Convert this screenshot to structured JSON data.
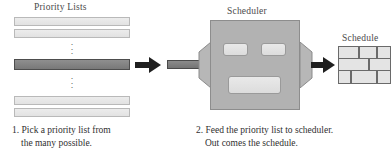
{
  "diagram": {
    "labels": {
      "priority_lists": "Priority Lists",
      "scheduler": "Scheduler",
      "schedule": "Schedule"
    },
    "priority_lists": {
      "bars": [
        {
          "state": "unselected"
        },
        {
          "state": "unselected"
        },
        {
          "state": "selected"
        },
        {
          "state": "unselected"
        },
        {
          "state": "unselected"
        }
      ],
      "ellipsis_glyph": "·",
      "ellipsis_count": 3,
      "selected_index": 2
    },
    "arrows": [
      {
        "name": "feed-arrow",
        "direction": "right"
      },
      {
        "name": "output-arrow",
        "direction": "right"
      }
    ],
    "scheduler": {
      "slots": [
        {
          "name": "slot-left"
        },
        {
          "name": "slot-right"
        },
        {
          "name": "slot-bottom"
        }
      ],
      "funnels": [
        {
          "name": "intake-funnel"
        },
        {
          "name": "output-funnel"
        }
      ]
    },
    "schedule": {
      "type": "brick-grid",
      "rows": 3,
      "bricks": [
        {
          "row": 1,
          "x": 0,
          "w": 21
        },
        {
          "row": 1,
          "x": 21,
          "w": 18
        },
        {
          "row": 1,
          "x": 39,
          "w": 13
        },
        {
          "row": 2,
          "x": 0,
          "w": 30
        },
        {
          "row": 2,
          "x": 30,
          "w": 22
        },
        {
          "row": 3,
          "x": 0,
          "w": 12
        },
        {
          "row": 3,
          "x": 12,
          "w": 26
        },
        {
          "row": 3,
          "x": 38,
          "w": 14
        }
      ]
    },
    "captions": [
      {
        "number": "1.",
        "line1": "1. Pick a priority list from",
        "line2": "the many possible."
      },
      {
        "number": "2.",
        "line1": "2. Feed the priority list to scheduler.",
        "line2": "Out comes the schedule."
      }
    ],
    "colors": {
      "bar_fill": "#e7e7e7",
      "bar_selected_fill": "#828282",
      "machine_fill": "#b2b2b2",
      "brick_fill": "#e4e4e4",
      "arrow_fill": "#1f1f1f",
      "text": "#2f2f2f"
    }
  }
}
